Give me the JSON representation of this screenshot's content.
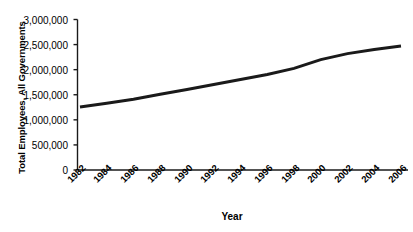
{
  "chart_data": {
    "type": "line",
    "title": "",
    "xlabel": "Year",
    "ylabel": "Total Employees, All Governments",
    "x": [
      1982,
      1984,
      1986,
      1988,
      1990,
      1992,
      1994,
      1996,
      1998,
      2000,
      2002,
      2004,
      2006
    ],
    "categories": [
      "1982",
      "1984",
      "1986",
      "1988",
      "1990",
      "1992",
      "1994",
      "1996",
      "1998",
      "2000",
      "2002",
      "2004",
      "2006"
    ],
    "values": [
      1255000,
      1330000,
      1410000,
      1510000,
      1605000,
      1705000,
      1805000,
      1905000,
      2025000,
      2200000,
      2320000,
      2400000,
      2470000
    ],
    "series": [
      {
        "name": "Total Employees, All Governments",
        "values": [
          1255000,
          1330000,
          1410000,
          1510000,
          1605000,
          1705000,
          1805000,
          1905000,
          2025000,
          2200000,
          2320000,
          2400000,
          2470000
        ]
      }
    ],
    "ylim": [
      0,
      3000000
    ],
    "xlim": [
      1982,
      2006
    ],
    "ytick_labels": [
      "3,000,000",
      "2,500,000",
      "2,000,000",
      "1,500,000",
      "1,000,000",
      "500,000",
      "0"
    ],
    "ytick_values": [
      3000000,
      2500000,
      2000000,
      1500000,
      1000000,
      500000,
      0
    ],
    "ytick_step": 500000,
    "grid": false,
    "legend": false,
    "legend_position": "none",
    "line_color": "#1a1a1a",
    "line_width": 3,
    "axis_color": "#1a1a1a",
    "background_color": "#ffffff",
    "markers": false,
    "xtick_marks": false,
    "ytick_marks": true
  }
}
